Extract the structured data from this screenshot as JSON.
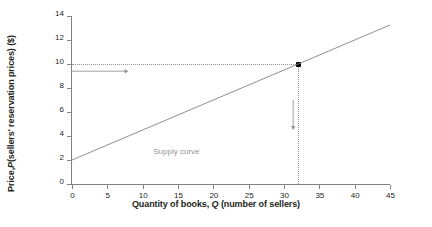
{
  "chart_data": {
    "type": "line",
    "title": "",
    "xlabel_parts": {
      "pre": "Quantity of books, ",
      "italic": "Q",
      "post": " (number of sellers)"
    },
    "ylabel_parts": {
      "pre": "Price, ",
      "italic": "P",
      "post": " (sellers' reservation prices) ($)"
    },
    "xlabel": "Quantity of books, Q (number of sellers)",
    "ylabel": "Price, P (sellers' reservation prices) ($)",
    "xlim": [
      0,
      45
    ],
    "ylim": [
      0,
      14
    ],
    "xticks": [
      0,
      5,
      10,
      15,
      20,
      25,
      30,
      35,
      40,
      45
    ],
    "yticks": [
      0,
      2,
      4,
      6,
      8,
      10,
      12,
      14
    ],
    "grid": false,
    "legend": "none",
    "series": [
      {
        "name": "Supply curve",
        "label": "Supply curve",
        "type": "line",
        "x": [
          0,
          45
        ],
        "values": [
          2,
          13.25
        ],
        "intercept": 2,
        "slope": 0.25,
        "color": "#808285"
      }
    ],
    "annotations": [
      {
        "name": "supply-curve-label",
        "text": "Supply curve",
        "x": 11.5,
        "y": 2.7,
        "color": "#939598"
      },
      {
        "name": "price-guide-line",
        "text": "",
        "type": "dotted-horizontal",
        "y": 10,
        "x_from": 0,
        "x_to": 32
      },
      {
        "name": "quantity-guide-line",
        "text": "",
        "type": "dotted-vertical",
        "x": 32,
        "y_from": 0,
        "y_to": 10
      },
      {
        "name": "equilibrium-point",
        "text": "",
        "type": "marker",
        "x": 32,
        "y": 10
      },
      {
        "name": "horizontal-arrow",
        "text": "",
        "type": "arrow-right",
        "x_from": 0,
        "x_to": 8,
        "y": 9.4
      },
      {
        "name": "vertical-arrow",
        "text": "",
        "type": "arrow-down",
        "x": 31.3,
        "y_from": 7.0,
        "y_to": 4.5
      }
    ]
  }
}
